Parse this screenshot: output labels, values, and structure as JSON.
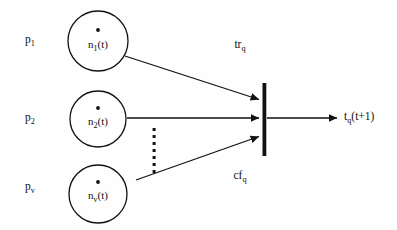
{
  "figure": {
    "type": "neural-node-diagram",
    "background_color": "#fefefe",
    "stroke_color": "#111111"
  },
  "inputs": [
    {
      "name": "p1",
      "label_base": "p",
      "label_sub": "1",
      "x": 30,
      "y": 41
    },
    {
      "name": "p2",
      "label_base": "p",
      "label_sub": "2",
      "x": 30,
      "y": 119
    },
    {
      "name": "pv",
      "label_base": "p",
      "label_sub": "v",
      "x": 30,
      "y": 188
    }
  ],
  "nodes": [
    {
      "name": "n1",
      "label_base": "n",
      "label_sub": "1",
      "label_tail": "(t)",
      "cx": 98,
      "cy": 41,
      "r": 30
    },
    {
      "name": "n2",
      "label_base": "n",
      "label_sub": "2",
      "label_tail": "(t)",
      "cx": 98,
      "cy": 119,
      "r": 28
    },
    {
      "name": "nv",
      "label_base": "n",
      "label_sub": "v",
      "label_tail": "(t)",
      "cx": 98,
      "cy": 194,
      "r": 29
    }
  ],
  "weights": [
    {
      "name": "tr-q",
      "label_base": "tr",
      "label_sub": "q",
      "x": 240,
      "y": 46
    },
    {
      "name": "cf-q",
      "label_base": "cf",
      "label_sub": "q",
      "x": 240,
      "y": 177
    }
  ],
  "output": {
    "name": "tq-t-plus-1",
    "label_base": "t",
    "label_sub": "q",
    "label_tail": "(t+1)",
    "x": 344,
    "y": 118
  },
  "summation_bar": {
    "x": 264,
    "y_top": 83,
    "y_bottom": 156,
    "width": 4
  },
  "ellipsis": {
    "x": 154,
    "y_start": 128,
    "y_end": 170,
    "dot_count": 7,
    "dot_size": 3
  },
  "connections": [
    {
      "name": "edge-n1-to-sum",
      "x1": 125,
      "y1": 56,
      "x2": 261,
      "y2": 100
    },
    {
      "name": "edge-n2-to-sum",
      "x1": 127,
      "y1": 118,
      "x2": 261,
      "y2": 118
    },
    {
      "name": "edge-nv-to-sum",
      "x1": 136,
      "y1": 180,
      "x2": 261,
      "y2": 136
    },
    {
      "name": "edge-sum-to-output",
      "x1": 267,
      "y1": 118,
      "x2": 339,
      "y2": 118
    }
  ]
}
